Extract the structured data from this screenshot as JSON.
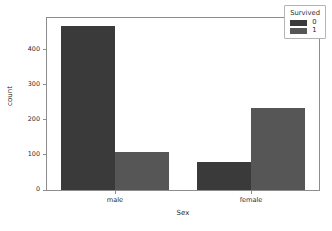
{
  "chart_data": {
    "type": "bar",
    "title": "",
    "xlabel": "Sex",
    "ylabel": "count",
    "categories": [
      "male",
      "female"
    ],
    "series": [
      {
        "name": "0",
        "values": [
          468,
          109
        ],
        "color": "#3a3a3a"
      },
      {
        "name": "1",
        "values": [
          109,
          233
        ],
        "color": "#565656"
      }
    ],
    "data_points": [
      {
        "category": "male",
        "survived": "0",
        "count": 468
      },
      {
        "category": "male",
        "survived": "1",
        "count": 109
      },
      {
        "category": "female",
        "survived": "0",
        "count": 81
      },
      {
        "category": "female",
        "survived": "1",
        "count": 233
      }
    ],
    "ylim": [
      0,
      490
    ],
    "yticks": [
      0,
      100,
      200,
      300,
      400
    ],
    "ytick_labels": [
      "0",
      "100",
      "200",
      "300",
      "400"
    ],
    "xtick_labels": [
      "male",
      "female"
    ],
    "grid": false,
    "legend": {
      "title": "Survived",
      "position": "upper right",
      "entries": [
        {
          "label": "0",
          "color": "#3a3a3a"
        },
        {
          "label": "1",
          "color": "#565656"
        }
      ]
    }
  },
  "axes": {
    "xlabel": "Sex",
    "ylabel": "count"
  },
  "colors": {
    "bar_survived_0": "#3a3a3a",
    "bar_survived_1": "#565656",
    "axis": "#8d8d8d",
    "text": "#2b2b2b",
    "background": "#ffffff"
  }
}
